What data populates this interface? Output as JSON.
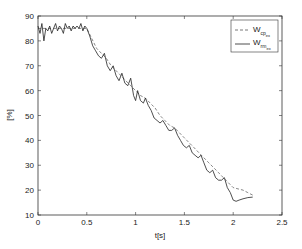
{
  "chart_data": {
    "type": "line",
    "title": "",
    "xlabel": "t[s]",
    "ylabel": "[%]",
    "xlim": [
      0,
      2.5
    ],
    "ylim": [
      10,
      90
    ],
    "xticks": [
      0,
      0.5,
      1,
      1.5,
      2,
      2.5
    ],
    "xtick_labels": [
      "0",
      "0.5",
      "1",
      "1.5",
      "2",
      "2.5"
    ],
    "yticks": [
      10,
      20,
      30,
      40,
      50,
      60,
      70,
      80,
      90
    ],
    "ytick_labels": [
      "10",
      "20",
      "30",
      "40",
      "50",
      "60",
      "70",
      "80",
      "90"
    ],
    "grid": false,
    "legend_position": "upper right",
    "series": [
      {
        "name": "W_cp_ex",
        "label_main": "W",
        "label_sub": "cp",
        "label_subsub": "ex",
        "style": "dashed",
        "color": "#555555",
        "x": [
          0,
          0.5,
          0.55,
          0.6,
          0.65,
          0.7,
          0.75,
          0.8,
          0.85,
          0.9,
          0.95,
          1.0,
          1.05,
          1.1,
          1.15,
          1.2,
          1.25,
          1.3,
          1.35,
          1.4,
          1.45,
          1.5,
          1.55,
          1.6,
          1.65,
          1.7,
          1.75,
          1.8,
          1.85,
          1.9,
          1.95,
          2.0,
          2.05,
          2.1,
          2.15,
          2.2
        ],
        "y": [
          85,
          85,
          81,
          77,
          75,
          73,
          70,
          68,
          66,
          64,
          62,
          60,
          58,
          57,
          55,
          53,
          50,
          48,
          46,
          45,
          43,
          41,
          39,
          37,
          35,
          33,
          31,
          29,
          27,
          25,
          23,
          21,
          20.5,
          20,
          19,
          18
        ]
      },
      {
        "name": "W_rm_ex",
        "label_main": "W",
        "label_sub": "rm",
        "label_subsub": "ex",
        "style": "solid",
        "color": "#222222",
        "x": [
          0,
          0.02,
          0.04,
          0.06,
          0.08,
          0.1,
          0.12,
          0.14,
          0.16,
          0.18,
          0.2,
          0.22,
          0.24,
          0.26,
          0.28,
          0.3,
          0.32,
          0.34,
          0.36,
          0.38,
          0.4,
          0.42,
          0.44,
          0.46,
          0.48,
          0.5,
          0.53,
          0.56,
          0.59,
          0.62,
          0.65,
          0.68,
          0.71,
          0.74,
          0.77,
          0.8,
          0.83,
          0.86,
          0.89,
          0.92,
          0.95,
          0.98,
          1.0,
          1.02,
          1.05,
          1.08,
          1.1,
          1.13,
          1.16,
          1.19,
          1.22,
          1.25,
          1.28,
          1.31,
          1.34,
          1.37,
          1.4,
          1.43,
          1.46,
          1.49,
          1.52,
          1.55,
          1.58,
          1.61,
          1.64,
          1.67,
          1.7,
          1.73,
          1.76,
          1.79,
          1.82,
          1.85,
          1.88,
          1.91,
          1.94,
          1.97,
          2.0,
          2.03,
          2.06,
          2.1,
          2.15,
          2.2
        ],
        "y": [
          86,
          83,
          87,
          80,
          85,
          84,
          86,
          83,
          85,
          87,
          84,
          86,
          85,
          83,
          87,
          85,
          86,
          84,
          86,
          85,
          86,
          85,
          87,
          84,
          86,
          85,
          82,
          78,
          76,
          74,
          73,
          75,
          70,
          68,
          70,
          66,
          64,
          67,
          63,
          62,
          65,
          58,
          56,
          60,
          56,
          55,
          57,
          54,
          52,
          49,
          48,
          47,
          48,
          46,
          44,
          44,
          45,
          42,
          40,
          38,
          37,
          38,
          35,
          34,
          33,
          34,
          31,
          28,
          27,
          28,
          25,
          24,
          24,
          25,
          21,
          19,
          16,
          15.5,
          16,
          16.5,
          17,
          17.2
        ]
      }
    ]
  },
  "legend": {
    "items": [
      {
        "main": "W",
        "sub": "cp",
        "subsub": "ex"
      },
      {
        "main": "W",
        "sub": "rm",
        "subsub": "ex"
      }
    ]
  },
  "axes": {
    "xlabel": "t[s]",
    "ylabel": "[%]"
  }
}
